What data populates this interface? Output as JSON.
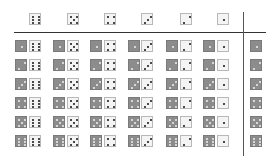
{
  "header": {
    "column_values": [
      6,
      5,
      4,
      3,
      2,
      1
    ]
  },
  "grid": {
    "row_values": [
      1,
      2,
      3,
      4,
      5,
      6
    ],
    "column_values": [
      6,
      5,
      4,
      3,
      2,
      1
    ],
    "cell_description": "each cell = gray die (row value) + white die (column value)"
  },
  "right_column": {
    "values": [
      1,
      2,
      3,
      4,
      5,
      6
    ]
  },
  "colors": {
    "gray_die": "#8c8c8c",
    "white_die": "#f4f4f4",
    "pip_dark": "#111111",
    "pip_light": "#f0f0f0",
    "rule": "#333333"
  }
}
